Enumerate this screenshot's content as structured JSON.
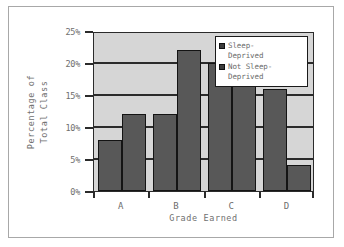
{
  "chart_data": {
    "type": "bar",
    "title": "",
    "xlabel": "Grade Earned",
    "ylabel_lines": [
      "Percentage of",
      "Total Class"
    ],
    "ylabel": "Percentage of Total Class",
    "categories": [
      "A",
      "B",
      "C",
      "D"
    ],
    "series": [
      {
        "name": "Sleep-Deprived",
        "values": [
          8,
          12,
          20,
          16
        ],
        "color": "#585858"
      },
      {
        "name": "Not Sleep-Deprived",
        "values": [
          12,
          22,
          20,
          4
        ],
        "color": "#585858"
      }
    ],
    "ylim": [
      0,
      25
    ],
    "yticks": [
      0,
      5,
      10,
      15,
      20,
      25
    ],
    "ytick_labels": [
      "0%",
      "5%",
      "10%",
      "15%",
      "20%",
      "25%"
    ],
    "grid": true,
    "grid_axis": "y",
    "legend_position": "top-right",
    "plot_background": "#d6d6d6",
    "figure_background": "#ffffff",
    "axis_color": "#2b2b2b",
    "bar_edge_color": "#141414"
  },
  "legend": {
    "entries": [
      {
        "label": "Sleep-\nDeprived",
        "swatch": "legend-swatch-sleep-deprived"
      },
      {
        "label": "Not Sleep-\nDeprived",
        "swatch": "legend-swatch-not-sleep-deprived"
      }
    ]
  },
  "axes": {
    "y_labels": [
      "25%",
      "20%",
      "15%",
      "10%",
      "5%",
      "0%"
    ],
    "x_labels": [
      "A",
      "B",
      "C",
      "D"
    ],
    "x_title": "Grade Earned",
    "y_title_line1": "Percentage of",
    "y_title_line2": "Total Class"
  }
}
